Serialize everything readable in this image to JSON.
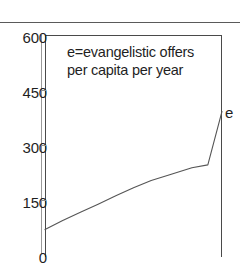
{
  "figure": {
    "top_rule": true,
    "plot": {
      "background": "#ffffff",
      "frame_color": "#4a4a4a",
      "left_px": 45,
      "top_px": 35,
      "right_px": 222,
      "bottom_clipped": true
    }
  },
  "annotation": {
    "line1": "e=evangelistic offers",
    "line2": "per capita per year"
  },
  "series_labels": {
    "e": "e"
  },
  "chart_data": {
    "type": "line",
    "title": "",
    "subtitle": "",
    "xlabel": "",
    "ylabel": "",
    "annotations": [
      "e=evangelistic offers",
      "per capita per year"
    ],
    "legend": {
      "position": "right-edge-inline",
      "entries": [
        "e"
      ]
    },
    "grid": false,
    "ylim": [
      0,
      600
    ],
    "yticks": [
      0,
      150,
      300,
      450,
      600
    ],
    "ytick_labels": [
      "0",
      "150",
      "300",
      "450",
      "600"
    ],
    "xlim": [
      0,
      100
    ],
    "xticks": [],
    "xtick_labels": [],
    "x_axis_clipped_bottom": true,
    "series": [
      {
        "name": "e",
        "label": "e",
        "color": "#555555",
        "end_label": "e",
        "x": [
          0,
          10,
          20,
          30,
          40,
          50,
          60,
          70,
          83,
          92,
          100
        ],
        "values": [
          70,
          95,
          118,
          140,
          163,
          185,
          205,
          220,
          240,
          248,
          395
        ]
      }
    ]
  }
}
